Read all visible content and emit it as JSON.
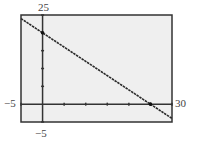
{
  "window": {
    "xmin_label": "−5",
    "xmax_label": "30",
    "ymin_label": "−5",
    "ymax_label": "25"
  },
  "chart_data": {
    "type": "line",
    "title": "",
    "xlabel": "",
    "ylabel": "",
    "xlim": [
      -5,
      30
    ],
    "ylim": [
      -5,
      25
    ],
    "xscale": 5,
    "yscale": 5,
    "grid": false,
    "series": [
      {
        "name": "y = 20 − 0.8x",
        "x": [
          -5,
          0,
          25,
          30
        ],
        "y": [
          24,
          20,
          0,
          -4
        ]
      }
    ],
    "points": [
      {
        "label": "y-intercept",
        "x": 0,
        "y": 20
      },
      {
        "label": "x-intercept",
        "x": 25,
        "y": 0
      }
    ],
    "colors": {
      "background": "#efefef",
      "line": "#2a2a2a",
      "frame": "#333333"
    }
  }
}
